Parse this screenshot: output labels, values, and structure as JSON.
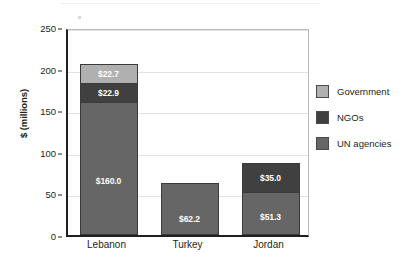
{
  "chart_data": {
    "type": "bar",
    "subtype": "stacked-bar",
    "title": "",
    "xlabel": "",
    "ylabel": "$ (millions)",
    "categories": [
      "Lebanon",
      "Turkey",
      "Jordan"
    ],
    "ylim": [
      0,
      250
    ],
    "yticks": [
      0,
      50,
      100,
      150,
      200,
      250
    ],
    "ytick_labels": [
      "0",
      "50",
      "100",
      "150",
      "200",
      "250"
    ],
    "grid": true,
    "grid_axis": "y",
    "legend_position": "right",
    "series": [
      {
        "name": "UN agencies",
        "color": "#666666",
        "values": [
          160.0,
          62.2,
          51.3
        ],
        "labels": [
          "$160.0",
          "$62.2",
          "$51.3"
        ]
      },
      {
        "name": "NGOs",
        "color": "#404040",
        "values": [
          22.9,
          0,
          35.0
        ],
        "labels": [
          "$22.9",
          "",
          "$35.0"
        ]
      },
      {
        "name": "Government",
        "color": "#b0b0b0",
        "values": [
          22.7,
          0,
          0
        ],
        "labels": [
          "$22.7",
          "",
          ""
        ]
      }
    ],
    "totals": [
      205.6,
      62.2,
      86.3
    ]
  },
  "axes": {
    "y_title": "$ (millions)",
    "y_ticks": [
      "250",
      "200",
      "150",
      "100",
      "50",
      "0"
    ],
    "x_ticks": [
      "Lebanon",
      "Turkey",
      "Jordan"
    ]
  },
  "legend": {
    "items": [
      {
        "label": "Government",
        "color": "#b0b0b0"
      },
      {
        "label": "NGOs",
        "color": "#404040"
      },
      {
        "label": "UN agencies",
        "color": "#666666"
      }
    ]
  },
  "bar_labels": {
    "lebanon_government": "$22.7",
    "lebanon_ngos": "$22.9",
    "lebanon_un": "$160.0",
    "turkey_un": "$62.2",
    "jordan_ngos": "$35.0",
    "jordan_un": "$51.3"
  },
  "colors": {
    "government": "#b0b0b0",
    "ngos": "#404040",
    "un_agencies": "#666666",
    "axis": "#231f20",
    "grid": "#e2e2e2",
    "background": "#ffffff"
  }
}
